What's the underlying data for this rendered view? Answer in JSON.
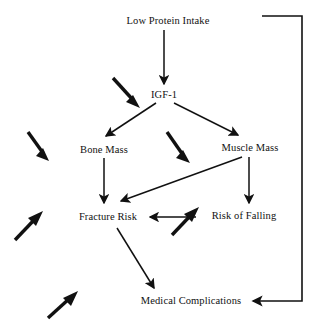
{
  "diagram": {
    "stroke_color": "#111111",
    "background_color": "#ffffff",
    "nodes": [
      {
        "id": "low_protein_intake",
        "label": "Low Protein Intake",
        "x": 168,
        "y": 21
      },
      {
        "id": "igf_1",
        "label": "IGF-1",
        "x": 164,
        "y": 95
      },
      {
        "id": "bone_mass",
        "label": "Bone Mass",
        "x": 104,
        "y": 150
      },
      {
        "id": "muscle_mass",
        "label": "Muscle Mass",
        "x": 250,
        "y": 148
      },
      {
        "id": "fracture_risk",
        "label": "Fracture Risk",
        "x": 108,
        "y": 217
      },
      {
        "id": "risk_of_falling",
        "label": "Risk of Falling",
        "x": 244,
        "y": 216
      },
      {
        "id": "medical_complications",
        "label": "Medical Complications",
        "x": 191,
        "y": 301
      }
    ],
    "edges": [
      {
        "id": "edge-low-protein-to-igf1",
        "from": "low_protein_intake",
        "to": "igf_1",
        "style": "thin"
      },
      {
        "id": "edge-igf1-to-bone-mass",
        "from": "igf_1",
        "to": "bone_mass",
        "style": "thin"
      },
      {
        "id": "edge-igf1-to-muscle-mass",
        "from": "igf_1",
        "to": "muscle_mass",
        "style": "thin"
      },
      {
        "id": "edge-bone-mass-to-fracture-risk",
        "from": "bone_mass",
        "to": "fracture_risk",
        "style": "thin"
      },
      {
        "id": "edge-muscle-mass-to-fracture-risk",
        "from": "muscle_mass",
        "to": "fracture_risk",
        "style": "thin"
      },
      {
        "id": "edge-muscle-mass-to-risk-of-falling",
        "from": "muscle_mass",
        "to": "risk_of_falling",
        "style": "thin"
      },
      {
        "id": "edge-risk-of-falling-to-fracture-risk",
        "from": "risk_of_falling",
        "to": "fracture_risk",
        "style": "thin"
      },
      {
        "id": "edge-fracture-risk-to-medical-complications",
        "from": "fracture_risk",
        "to": "medical_complications",
        "style": "thin"
      },
      {
        "id": "edge-medical-complications-feedback-to-low-protein-intake",
        "from": "medical_complications",
        "to": "low_protein_intake",
        "style": "thin-elbow"
      }
    ],
    "decrease_markers": [
      {
        "id": "decrease-marker-igf1",
        "target": "igf_1",
        "direction": "down-right"
      },
      {
        "id": "decrease-marker-bone-mass",
        "target": "bone_mass",
        "direction": "down-right"
      },
      {
        "id": "decrease-marker-muscle-mass",
        "target": "muscle_mass",
        "direction": "down-right"
      },
      {
        "id": "increase-marker-fracture-risk",
        "target": "fracture_risk",
        "direction": "up-right"
      },
      {
        "id": "increase-marker-risk-of-falling",
        "target": "risk_of_falling",
        "direction": "up-right"
      },
      {
        "id": "increase-marker-medical-complications",
        "target": "medical_complications",
        "direction": "up-right"
      }
    ]
  }
}
